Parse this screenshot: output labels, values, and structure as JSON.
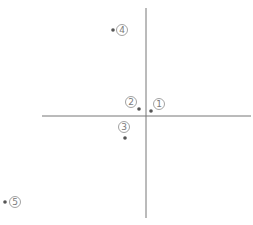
{
  "diagram": {
    "type": "quadrant-scatter",
    "axes": {
      "vertical": {
        "x": 146,
        "y1": 8,
        "y2": 218
      },
      "horizontal": {
        "y": 116,
        "x1": 42,
        "x2": 251
      },
      "color": "#777777"
    },
    "points": [
      {
        "id": "1",
        "label": "1",
        "dot": {
          "x": 151,
          "y": 111
        },
        "label_pos": {
          "x": 159,
          "y": 104
        }
      },
      {
        "id": "2",
        "label": "2",
        "dot": {
          "x": 139,
          "y": 109
        },
        "label_pos": {
          "x": 131,
          "y": 102
        }
      },
      {
        "id": "3",
        "label": "3",
        "dot": {
          "x": 125,
          "y": 138
        },
        "label_pos": {
          "x": 124,
          "y": 127
        }
      },
      {
        "id": "4",
        "label": "4",
        "dot": {
          "x": 113,
          "y": 30
        },
        "label_pos": {
          "x": 122,
          "y": 30
        }
      },
      {
        "id": "5",
        "label": "5",
        "dot": {
          "x": 5,
          "y": 202
        },
        "label_pos": {
          "x": 15,
          "y": 202
        }
      }
    ],
    "dot_color": "#555555",
    "label_color": "#7a7a7a"
  }
}
